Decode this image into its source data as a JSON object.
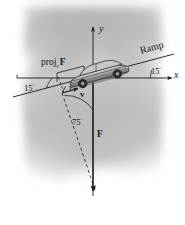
{
  "figure": {
    "type": "physics-vector-diagram",
    "axes": {
      "x_label": "x",
      "y_label": "y"
    },
    "labels": {
      "projection": "proj",
      "projection_subscript": "v",
      "projection_vector": "F",
      "ramp": "Ramp",
      "angle_left": "15",
      "angle_left_unit": "°",
      "angle_right": "15",
      "angle_right_unit": "°",
      "angle_between": "75",
      "angle_between_unit": "°",
      "velocity_vector": "v",
      "force_vector": "F"
    },
    "colors": {
      "ink": "#1a1a1a",
      "background_shade": "#b9b9b9",
      "car_body": "#9a9a9a",
      "car_outline": "#3a3a3a",
      "page": "#ffffff"
    },
    "geometry": {
      "origin_x": 93,
      "origin_y": 78,
      "ramp_incline_deg": 15,
      "force_direction_deg": 270,
      "projection_angle_deg": 75
    }
  }
}
